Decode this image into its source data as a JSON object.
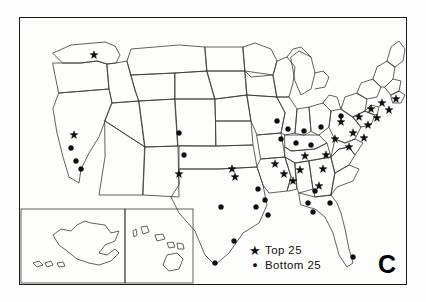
{
  "figure": {
    "panel_label": "C",
    "background_color": "#fefefe",
    "border_color": "#1a1a1a"
  },
  "legend": {
    "items": [
      {
        "glyph": "star-icon",
        "symbol": "★",
        "label": "Top 25"
      },
      {
        "glyph": "dot-icon",
        "symbol": "●",
        "label": "Bottom 25"
      }
    ]
  },
  "chart_data": {
    "type": "scatter",
    "title": "",
    "subtitle": "",
    "xlabel": "",
    "ylabel": "",
    "grid": false,
    "legend_position": "bottom-center",
    "map_projection": "united-states-with-alaska-hawaii-insets",
    "marker_color": "#0d0d0d",
    "outline_color": "#3a3a3a",
    "series": [
      {
        "name": "Top 25",
        "marker": "star",
        "count": 25,
        "points": [
          [
            75,
            38
          ],
          [
            55,
            118
          ],
          [
            160,
            157
          ],
          [
            213,
            152
          ],
          [
            216,
            160
          ],
          [
            256,
            147
          ],
          [
            265,
            157
          ],
          [
            274,
            164
          ],
          [
            281,
            153
          ],
          [
            286,
            139
          ],
          [
            300,
            169
          ],
          [
            304,
            152
          ],
          [
            307,
            138
          ],
          [
            316,
            122
          ],
          [
            322,
            105
          ],
          [
            330,
            130
          ],
          [
            334,
            116
          ],
          [
            340,
            100
          ],
          [
            345,
            121
          ],
          [
            349,
            108
          ],
          [
            352,
            92
          ],
          [
            358,
            101
          ],
          [
            363,
            86
          ],
          [
            370,
            93
          ],
          [
            377,
            82
          ]
        ]
      },
      {
        "name": "Bottom 25",
        "marker": "dot",
        "count": 25,
        "points": [
          [
            52,
            131
          ],
          [
            57,
            144
          ],
          [
            62,
            152
          ],
          [
            160,
            116
          ],
          [
            165,
            138
          ],
          [
            237,
            190
          ],
          [
            239,
            172
          ],
          [
            246,
            183
          ],
          [
            249,
            198
          ],
          [
            202,
            190
          ],
          [
            215,
            224
          ],
          [
            196,
            246
          ],
          [
            258,
            104
          ],
          [
            262,
            122
          ],
          [
            269,
            112
          ],
          [
            277,
            126
          ],
          [
            285,
            114
          ],
          [
            292,
            128
          ],
          [
            296,
            174
          ],
          [
            289,
            186
          ],
          [
            294,
            195
          ],
          [
            302,
            110
          ],
          [
            311,
            186
          ],
          [
            334,
            240
          ],
          [
            322,
            99
          ]
        ]
      }
    ]
  }
}
